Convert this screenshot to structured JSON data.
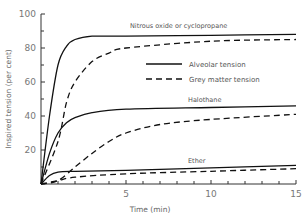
{
  "chart_data": {
    "type": "line",
    "title": "",
    "xlabel": "Time (min)",
    "ylabel": "Inspired tension (per cent)",
    "xlim": [
      0,
      15
    ],
    "ylim": [
      0,
      100
    ],
    "x_ticks": [
      "5",
      "10",
      "15"
    ],
    "y_ticks": [
      "20",
      "40",
      "60",
      "80",
      "100"
    ],
    "grid": false,
    "legend": {
      "position": "upper-right-inside",
      "entries": [
        {
          "label": "Alveolar tension",
          "style": "solid"
        },
        {
          "label": "Grey matter tension",
          "style": "dashed"
        }
      ]
    },
    "annotations": [
      "Nitrous oxide or cyclopropane",
      "Halothane",
      "Ether"
    ],
    "series": [
      {
        "name": "Nitrous oxide or cyclopropane - Alveolar tension",
        "style": "solid",
        "x": [
          0,
          0.5,
          1,
          1.5,
          2,
          3,
          5,
          10,
          15
        ],
        "y": [
          0,
          40,
          70,
          81,
          85,
          87,
          87,
          87.5,
          88
        ]
      },
      {
        "name": "Nitrous oxide or cyclopropane - Grey matter tension",
        "style": "dashed",
        "x": [
          0,
          1,
          1.5,
          2,
          3,
          4,
          5,
          10,
          15
        ],
        "y": [
          0,
          25,
          48,
          60,
          72,
          77,
          80,
          84,
          85
        ]
      },
      {
        "name": "Halothane - Alveolar tension",
        "style": "solid",
        "x": [
          0,
          0.5,
          1,
          1.5,
          2,
          3,
          5,
          10,
          15
        ],
        "y": [
          0,
          18,
          30,
          36,
          39,
          42,
          44,
          45,
          46
        ]
      },
      {
        "name": "Halothane - Grey matter tension",
        "style": "dashed",
        "x": [
          0,
          1,
          2,
          3,
          4,
          5,
          7,
          10,
          15
        ],
        "y": [
          0,
          2,
          10,
          18,
          25,
          30,
          35,
          38,
          41
        ]
      },
      {
        "name": "Ether - Alveolar tension",
        "style": "solid",
        "x": [
          0,
          0.5,
          1,
          2,
          5,
          10,
          15
        ],
        "y": [
          0,
          5,
          7,
          7.5,
          8,
          9.5,
          11
        ]
      },
      {
        "name": "Ether - Grey matter tension",
        "style": "dashed",
        "x": [
          0,
          1,
          2,
          5,
          10,
          15
        ],
        "y": [
          0,
          2,
          4,
          6,
          7.5,
          9
        ]
      }
    ]
  }
}
